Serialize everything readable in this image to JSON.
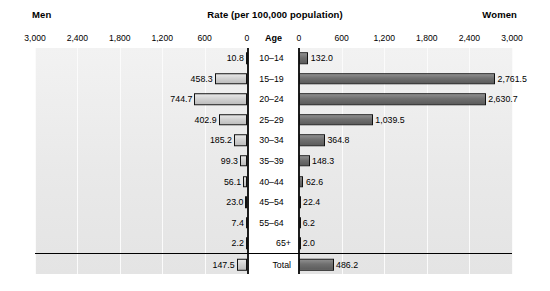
{
  "header": {
    "left_label": "Men",
    "title": "Rate (per 100,000 population)",
    "right_label": "Women",
    "age_header": "Age"
  },
  "axis": {
    "left_ticks": [
      "3,000",
      "2,400",
      "1,800",
      "1,200",
      "600",
      "0"
    ],
    "right_ticks": [
      "0",
      "600",
      "1,200",
      "1,800",
      "2,400",
      "3,000"
    ],
    "max": 3000,
    "tick_step": 600
  },
  "colors": {
    "men_bar": "#d2d2d2",
    "women_bar": "#6f6f6f",
    "plot_background": "#e9e9e9",
    "axis": "#1d1d1d",
    "gridline": "#fbfbfb"
  },
  "chart_data": {
    "type": "bar",
    "title": "Rate (per 100,000 population)",
    "xlabel": "Rate (per 100,000 population)",
    "ylabel": "Age",
    "xlim": [
      0,
      3000
    ],
    "grid": true,
    "legend_position": "top",
    "orientation": "horizontal-diverging",
    "categories": [
      "10–14",
      "15–19",
      "20–24",
      "25–29",
      "30–34",
      "35–39",
      "40–44",
      "45–54",
      "55–64",
      "65+",
      "Total"
    ],
    "series": [
      {
        "name": "Men",
        "side": "left",
        "values": [
          10.8,
          458.3,
          744.7,
          402.9,
          185.2,
          99.3,
          56.1,
          23.0,
          7.4,
          2.2,
          147.5
        ],
        "labels": [
          "10.8",
          "458.3",
          "744.7",
          "402.9",
          "185.2",
          "99.3",
          "56.1",
          "23.0",
          "7.4",
          "2.2",
          "147.5"
        ]
      },
      {
        "name": "Women",
        "side": "right",
        "values": [
          132.0,
          2761.5,
          2630.7,
          1039.5,
          364.8,
          148.3,
          62.6,
          22.4,
          6.2,
          2.0,
          486.2
        ],
        "labels": [
          "132.0",
          "2,761.5",
          "2,630.7",
          "1,039.5",
          "364.8",
          "148.3",
          "62.6",
          "22.4",
          "6.2",
          "2.0",
          "486.2"
        ]
      }
    ]
  }
}
